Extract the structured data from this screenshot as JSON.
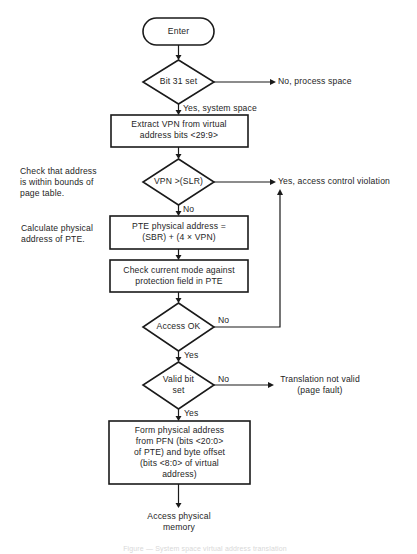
{
  "diagram": {
    "type": "flowchart",
    "start": {
      "label": "Enter"
    },
    "nodes": [
      {
        "id": "d_bit31",
        "kind": "decision",
        "lines": [
          "Bit 31 set"
        ]
      },
      {
        "id": "p_extract",
        "kind": "process",
        "lines": [
          "Extract VPN from virtual",
          "address bits <29:9>"
        ]
      },
      {
        "id": "d_bounds",
        "kind": "decision",
        "lines": [
          "VPN >(SLR)"
        ]
      },
      {
        "id": "p_pte_addr",
        "kind": "process",
        "lines": [
          "PTE physical address =",
          "(SBR) + (4 × VPN)"
        ]
      },
      {
        "id": "p_check_mode",
        "kind": "process",
        "lines": [
          "Check current mode against",
          "protection field in PTE"
        ]
      },
      {
        "id": "d_access",
        "kind": "decision",
        "lines": [
          "Access OK"
        ]
      },
      {
        "id": "d_valid",
        "kind": "decision",
        "lines": [
          "Valid bit",
          "set"
        ]
      },
      {
        "id": "p_form",
        "kind": "process",
        "lines": [
          "Form physical address",
          "from PFN (bits <20:0>",
          "of PTE) and byte offset",
          "(bits <8:0> of virtual",
          "address)"
        ]
      }
    ],
    "end": {
      "lines": [
        "Access physical",
        "memory"
      ]
    },
    "edge_labels": {
      "bit31_no": "No, process space",
      "bit31_yes": "Yes, system space",
      "bounds_yes": "Yes, access control violation",
      "bounds_no": "No",
      "access_no": "No",
      "access_yes": "Yes",
      "valid_no": "No",
      "valid_yes": "Yes"
    },
    "outcomes": {
      "page_fault": [
        "Translation not valid",
        "(page fault)"
      ]
    },
    "annotations": {
      "bounds_note": [
        "Check that address",
        "is within bounds of",
        "page table."
      ],
      "pte_note": [
        "Calculate physical",
        "address of PTE."
      ]
    },
    "caption": "Figure — System space virtual address translation",
    "colors": {
      "ink": "#1a1a1a",
      "background": "#ffffff"
    }
  }
}
